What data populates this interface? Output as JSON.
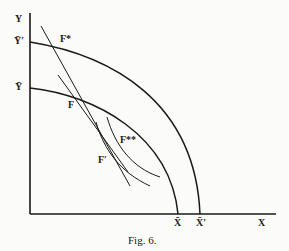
{
  "figure": {
    "caption": "Fig. 6.",
    "axes": {
      "y_label": "Y",
      "x_label": "X"
    },
    "labels": {
      "y_bar_prime": "Ȳ′",
      "y_bar": "Ȳ",
      "x_bar": "X̄",
      "x_bar_prime": "X̄′",
      "f_star": "F*",
      "f": "F",
      "f_prime": "F′",
      "f_double_star": "F**"
    },
    "curves": [
      {
        "name": "outer-frontier",
        "from": "Ȳ′",
        "to": "X̄′"
      },
      {
        "name": "inner-frontier",
        "from": "Ȳ",
        "to": "X̄"
      }
    ],
    "colors": {
      "ink": "#1a1a1a",
      "paper": "#fbfbf9"
    }
  }
}
